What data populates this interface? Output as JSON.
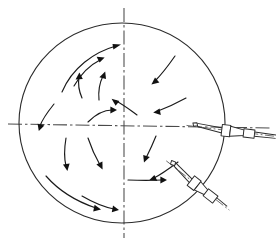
{
  "figure": {
    "title": "Spherical vessel cross-section with two inclined injection nozzles and internal swirling flow pattern",
    "kind": "engineering-line-drawing",
    "background_color": "#ffffff",
    "line_color": "#2b2b2b",
    "arrow_color": "#111111",
    "centerline_color": "#4a4a4a",
    "labels": [],
    "annotations": []
  },
  "vessel": {
    "name": "spherical-vessel",
    "shape": "circle",
    "center_x": 122,
    "center_y": 123,
    "radius_x": 103,
    "radius_y": 100,
    "stroke_width": 1.1
  },
  "centerlines": {
    "horizontal": {
      "name": "horizontal-centerline",
      "x1": 8,
      "y1": 124,
      "x2": 272,
      "y2": 128
    },
    "vertical": {
      "name": "vertical-centerline",
      "x1": 124,
      "y1": 8,
      "x2": 124,
      "y2": 238
    }
  },
  "nozzles": [
    {
      "id": "nozzle-upper-right",
      "name": "injection-nozzle-upper-right",
      "position": "right side, on the horizontal centerline",
      "angle_deg": 8,
      "parts": [
        "inner-tip",
        "tapered-shank",
        "wall-flange",
        "outer-cone",
        "outer-barrel",
        "supply-axis"
      ]
    },
    {
      "id": "nozzle-lower-right",
      "name": "injection-nozzle-lower-right",
      "position": "lower right quadrant",
      "angle_deg": 38,
      "parts": [
        "inner-tip",
        "tapered-shank",
        "wall-flange",
        "outer-cone",
        "outer-barrel",
        "supply-axis"
      ]
    }
  ],
  "flow_field": {
    "name": "internal-swirl-flow",
    "description": "Curved streamline arrows indicating recirculating swirl inside the vessel",
    "arrow_count": 16,
    "arrows": [
      {
        "id": "a1",
        "quadrant": "upper-left",
        "d": "M 62 92 C 72 68 94 52 116 46",
        "tip": [
          118,
          45.6
        ],
        "dir": [
          0.95,
          -0.28
        ]
      },
      {
        "id": "a2",
        "quadrant": "upper-left",
        "d": "M 74 86 C 82 72 92 64 100 60",
        "tip": [
          101.5,
          59.4
        ],
        "dir": [
          0.9,
          -0.44
        ]
      },
      {
        "id": "a3",
        "quadrant": "upper-left",
        "d": "M 82 98 C 78 88 78 82 79 77",
        "tip": [
          79.2,
          75.5
        ],
        "dir": [
          0.12,
          -0.99
        ]
      },
      {
        "id": "a4",
        "quadrant": "upper-left",
        "d": "M 99 100 C 98 90 100 82 103 76",
        "tip": [
          103.6,
          74.8
        ],
        "dir": [
          0.42,
          -0.9
        ]
      },
      {
        "id": "a5",
        "quadrant": "upper-right",
        "d": "M 175 56 C 168 66 162 74 155 81",
        "tip": [
          153.8,
          82.2
        ],
        "dir": [
          -0.72,
          0.7
        ]
      },
      {
        "id": "a6",
        "quadrant": "upper-right",
        "d": "M 186 98 C 175 104 166 108 158 111",
        "tip": [
          156.5,
          111.5
        ],
        "dir": [
          -0.93,
          0.34
        ]
      },
      {
        "id": "a7",
        "quadrant": "center",
        "d": "M 137 115 C 130 110 124 105 116 101",
        "tip": [
          114.6,
          100.2
        ],
        "dir": [
          -0.87,
          -0.5
        ]
      },
      {
        "id": "a8",
        "quadrant": "center-left",
        "d": "M 88 122 C 96 114 104 110 112 110",
        "tip": [
          113.6,
          110
        ],
        "dir": [
          0.99,
          0.05
        ]
      },
      {
        "id": "a9",
        "quadrant": "left",
        "d": "M 54 104 C 46 114 42 120 40 126",
        "tip": [
          39.6,
          127.4
        ],
        "dir": [
          -0.3,
          0.95
        ]
      },
      {
        "id": "a10",
        "quadrant": "lower-left",
        "d": "M 66 138 C 64 150 64 158 66 166",
        "tip": [
          66.4,
          167.6
        ],
        "dir": [
          0.25,
          0.97
        ]
      },
      {
        "id": "a11",
        "quadrant": "lower-left",
        "d": "M 88 138 C 92 150 96 158 100 165",
        "tip": [
          100.8,
          166.4
        ],
        "dir": [
          0.5,
          0.87
        ]
      },
      {
        "id": "a12",
        "quadrant": "lower-left",
        "d": "M 46 176 C 60 192 78 202 96 208",
        "tip": [
          97.6,
          208.4
        ],
        "dir": [
          0.95,
          0.3
        ]
      },
      {
        "id": "a13",
        "quadrant": "bottom",
        "d": "M 82 196 C 94 203 104 207 114 209",
        "tip": [
          115.6,
          209.2
        ],
        "dir": [
          0.99,
          0.14
        ]
      },
      {
        "id": "a14",
        "quadrant": "lower-right",
        "d": "M 156 136 C 152 146 149 152 146 158",
        "tip": [
          145.4,
          159.4
        ],
        "dir": [
          -0.4,
          0.92
        ]
      },
      {
        "id": "a15",
        "quadrant": "lower-right",
        "d": "M 178 162 C 170 168 162 174 154 178",
        "tip": [
          152.6,
          178.6
        ],
        "dir": [
          -0.88,
          0.47
        ]
      },
      {
        "id": "a16",
        "quadrant": "bottom-right",
        "d": "M 128 180 C 140 180 152 180 162 180",
        "tip": [
          163.6,
          180
        ],
        "dir": [
          1,
          0
        ]
      }
    ]
  }
}
